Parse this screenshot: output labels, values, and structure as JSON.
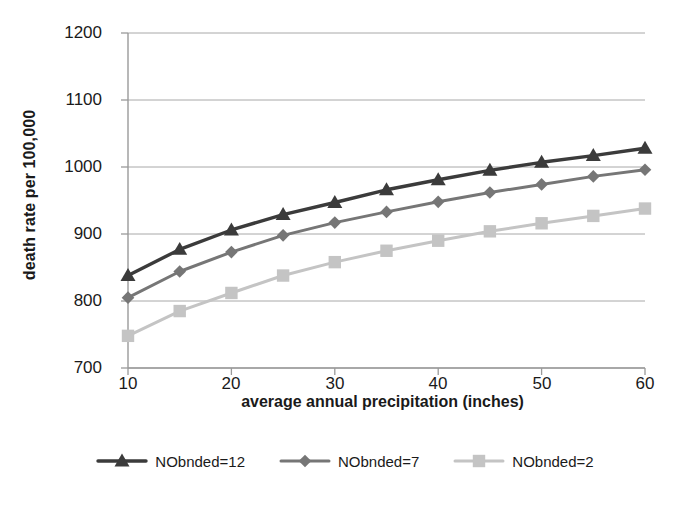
{
  "chart_data": {
    "type": "line",
    "title": "",
    "xlabel": "average annual precipitation (inches)",
    "ylabel": "death rate per 100,000",
    "xlim": [
      10,
      60
    ],
    "ylim": [
      700,
      1200
    ],
    "xticks": [
      "10",
      "20",
      "30",
      "40",
      "50",
      "60"
    ],
    "yticks": [
      "1200",
      "1100",
      "1000",
      "900",
      "800",
      "700"
    ],
    "x": [
      10,
      15,
      20,
      25,
      30,
      35,
      40,
      45,
      50,
      55,
      60
    ],
    "grid": "horizontal",
    "legend_position": "bottom",
    "series": [
      {
        "name": "NObnded=12",
        "color": "#3b3b3b",
        "marker": "triangle",
        "values": [
          838,
          877,
          906,
          929,
          947,
          966,
          981,
          995,
          1007,
          1017,
          1028
        ]
      },
      {
        "name": "NObnded=7",
        "color": "#767676",
        "marker": "diamond",
        "values": [
          805,
          844,
          873,
          898,
          917,
          933,
          948,
          962,
          974,
          986,
          996
        ]
      },
      {
        "name": "NObnded=2",
        "color": "#c4c4c4",
        "marker": "square",
        "values": [
          748,
          785,
          812,
          838,
          858,
          875,
          890,
          904,
          916,
          927,
          938
        ]
      }
    ]
  },
  "axis": {
    "x_title": "average annual precipitation (inches)",
    "y_title": "death rate per 100,000",
    "x_tick_labels": [
      "10",
      "20",
      "30",
      "40",
      "50",
      "60"
    ],
    "y_tick_labels": [
      "1200",
      "1100",
      "1000",
      "900",
      "800",
      "700"
    ]
  },
  "legend": {
    "items": [
      {
        "label": "NObnded=12",
        "color": "#3b3b3b",
        "marker": "triangle"
      },
      {
        "label": "NObnded=7",
        "color": "#767676",
        "marker": "diamond"
      },
      {
        "label": "NObnded=2",
        "color": "#c4c4c4",
        "marker": "square"
      }
    ]
  },
  "colors": {
    "axis": "#9a9a9a",
    "grid": "#a8a8a8",
    "text": "#1a1a1a",
    "background": "#ffffff"
  }
}
